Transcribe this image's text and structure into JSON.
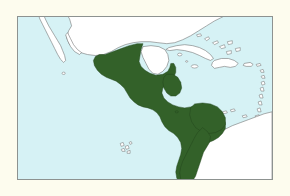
{
  "figure": {
    "kind": "range-distribution-map",
    "title": "",
    "caption": "",
    "page_background_color": "#fdfcee",
    "frame": {
      "border_color": "#8d9290",
      "border_width_px": 1,
      "left_px": 17,
      "top_px": 16,
      "width_px": 256,
      "height_px": 164
    }
  },
  "legend": {
    "visible": false,
    "entries": [
      {
        "label": "Range",
        "color": "#336129"
      },
      {
        "label": "Land outside range",
        "color": "#ffffff"
      },
      {
        "label": "Water",
        "color": "#d6f2f5"
      }
    ]
  },
  "colors": {
    "water": "#d6f2f5",
    "land": "#ffffff",
    "range_fill": "#336129",
    "range_stroke": "#22441a",
    "coastline": "#6a6a6a",
    "frame": "#8d9290",
    "page": "#fdfcee"
  },
  "map_content": {
    "region_name": "Middle America and northwestern South America",
    "water_bodies": [
      "Pacific Ocean",
      "Gulf of Mexico",
      "Caribbean Sea"
    ],
    "landmasses_outside_range": [
      "Baja California Peninsula",
      "Northern Mexico",
      "Yucatan Peninsula",
      "Cuba",
      "Jamaica",
      "Hispaniola",
      "Puerto Rico",
      "Lesser Antilles",
      "Bahamas",
      "Interior and eastern South America",
      "Galapagos Islands"
    ],
    "landmasses_in_range": [
      "Southern Mexico",
      "Guatemala",
      "Belize coast",
      "Honduras",
      "El Salvador",
      "Nicaragua",
      "Costa Rica",
      "Panama",
      "Northern Colombia",
      "Pacific coast of Colombia",
      "Coastal Ecuador"
    ]
  }
}
